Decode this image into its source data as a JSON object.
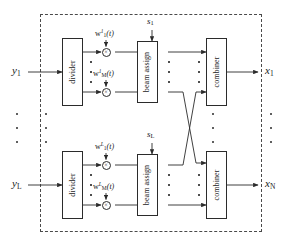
{
  "figure": {
    "type": "block-diagram",
    "boundary": {
      "style": "dashed",
      "label": ""
    }
  },
  "inputs": [
    {
      "id": "y1",
      "text": "y",
      "sub": "1"
    },
    {
      "id": "yL",
      "text": "y",
      "sub": "L"
    }
  ],
  "outputs": [
    {
      "id": "x1",
      "text": "x",
      "sub": "1"
    },
    {
      "id": "xN",
      "text": "x",
      "sub": "N"
    }
  ],
  "control_signals": [
    {
      "id": "s1",
      "text": "s",
      "sub": "1"
    },
    {
      "id": "sL",
      "text": "s",
      "sub": "L"
    }
  ],
  "blocks": {
    "divider": "divider",
    "beam_assign": "beam assign",
    "combiner": "combiner"
  },
  "rows": [
    {
      "id": "row-top",
      "divider_label": "divider",
      "beam_assign_label": "beam assign",
      "combiner_label": "combiner",
      "control": "s1",
      "weights": [
        {
          "base": "w",
          "sup": "1",
          "sub": "1",
          "arg": "(t)"
        },
        {
          "base": "w",
          "sup": "1",
          "sub": "M",
          "arg": "(t)"
        }
      ]
    },
    {
      "id": "row-bottom",
      "divider_label": "divider",
      "beam_assign_label": "beam assign",
      "combiner_label": "combiner",
      "control": "sL",
      "weights": [
        {
          "base": "w",
          "sup": "L",
          "sub": "1",
          "arg": "(t)"
        },
        {
          "base": "w",
          "sup": "L",
          "sub": "M",
          "arg": "(t)"
        }
      ]
    }
  ],
  "multiplier": {
    "glyph": "×",
    "count": 4
  },
  "ellipses": {
    "count": 8,
    "note": "vertical dot groups indicating repeated elements"
  },
  "colors": {
    "line": "#2b2b2b",
    "boundary": "#4a4a4a",
    "background": "#ffffff",
    "text": "#1a1a1a"
  }
}
